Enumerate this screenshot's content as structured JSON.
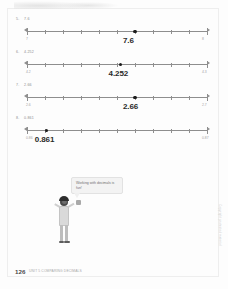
{
  "page": {
    "page_number": "126",
    "footer_caption": "UNIT 5 COMPARING DECIMALS",
    "side_note": "Copyright protected material"
  },
  "illustration": {
    "speech_bubble_text": "Working with decimals is fun!",
    "character_name": "student-character"
  },
  "problems": [
    {
      "number": "5.",
      "prompt": "7.6",
      "answer": "7.6",
      "left_label": "7",
      "right_label": "8",
      "point_percent": 60,
      "ticks": 10
    },
    {
      "number": "6.",
      "prompt": "4.252",
      "answer": "4.252",
      "left_label": "4.2",
      "right_label": "4.3",
      "point_percent": 52,
      "ticks": 10
    },
    {
      "number": "7.",
      "prompt": "2.66",
      "answer": "2.66",
      "left_label": "2.6",
      "right_label": "2.7",
      "point_percent": 60,
      "ticks": 10
    },
    {
      "number": "8.",
      "prompt": "0.861",
      "answer": "0.861",
      "left_label": "0.86",
      "right_label": "0.87",
      "point_percent": 11,
      "ticks": 10
    }
  ]
}
